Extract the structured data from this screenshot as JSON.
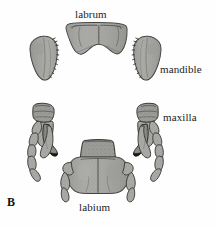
{
  "figure": {
    "panel_letter": "B",
    "background_color": "#fefefe",
    "ink_color": "#1c1c1c",
    "labels": {
      "labrum": "labrum",
      "mandible": "mandible",
      "maxilla": "maxilla",
      "labium": "labium"
    },
    "structures": {
      "labrum": {
        "name": "labrum",
        "fill": "#a9a9a6",
        "stroke": "#3a3a38",
        "position": "top-center"
      },
      "mandible_left": {
        "name": "mandible",
        "fill": "#a9a9a6",
        "stroke": "#3a3a38",
        "position": "upper-left"
      },
      "mandible_right": {
        "name": "mandible",
        "fill": "#a9a9a6",
        "stroke": "#3a3a38",
        "position": "upper-right"
      },
      "maxilla_left": {
        "name": "maxilla",
        "fill": "#a9a9a6",
        "stroke": "#3a3a38",
        "position": "lower-left"
      },
      "maxilla_right": {
        "name": "maxilla",
        "fill": "#a9a9a6",
        "stroke": "#3a3a38",
        "position": "lower-right"
      },
      "labium": {
        "name": "labium",
        "fill": "#a9a9a6",
        "stroke": "#3a3a38",
        "position": "bottom-center"
      }
    }
  }
}
